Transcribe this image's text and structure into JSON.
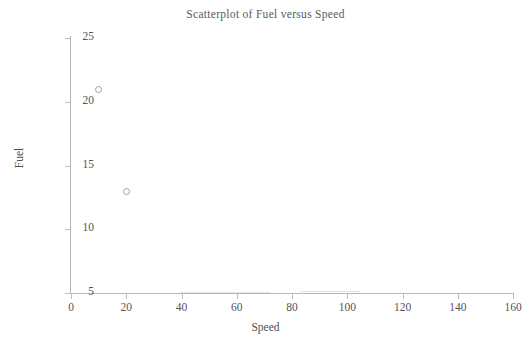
{
  "chart_data": {
    "type": "scatter",
    "title": "Scatterplot of Fuel versus Speed",
    "xlabel": "Speed",
    "ylabel": "Fuel",
    "xlim": [
      0,
      160
    ],
    "ylim": [
      5,
      25
    ],
    "xticks": [
      0,
      20,
      40,
      60,
      80,
      100,
      120,
      140,
      160
    ],
    "yticks": [
      5,
      10,
      15,
      20,
      25
    ],
    "xtick_labels": [
      "0",
      "20",
      "40",
      "60",
      "80",
      "100",
      "120",
      "140",
      "160"
    ],
    "ytick_labels": [
      "5",
      "10",
      "15",
      "20",
      "25"
    ],
    "grid": false,
    "legend": null,
    "marker": "open-circle",
    "marker_color": "#9e9e9e",
    "x": [
      10,
      20
    ],
    "y": [
      21,
      13
    ],
    "points": [
      {
        "x": 10,
        "y": 21
      },
      {
        "x": 20,
        "y": 13
      }
    ],
    "series": [
      {
        "name": "Fuel vs Speed",
        "x": [
          10,
          20
        ],
        "y": [
          21,
          13
        ]
      }
    ]
  },
  "colors": {
    "axis": "#b9b9b9",
    "text": "#4f4f4f",
    "marker": "#9e9e9e",
    "background": "#ffffff"
  }
}
